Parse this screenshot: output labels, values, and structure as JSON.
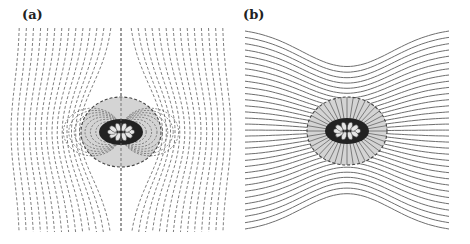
{
  "figure": {
    "panels": [
      {
        "id": "a",
        "label": "(a)",
        "line_style": "dashed",
        "line_orientation": "vertical",
        "region_shading": "#d4d4d4",
        "line_color": "#6e6e6e",
        "ellipse": {
          "cx": 121,
          "cy": 132,
          "rx": 40,
          "ry": 35
        },
        "field_extent": {
          "x0": 20,
          "x1": 222,
          "y0": 28,
          "y1": 232
        },
        "line_count": 29,
        "inner_core": {
          "petals": 10,
          "rx": 17,
          "ry": 9
        }
      },
      {
        "id": "b",
        "label": "(b)",
        "line_style": "solid",
        "line_orientation": "horizontal",
        "region_shading": "#d4d4d4",
        "line_color": "#6e6e6e",
        "ellipse": {
          "cx": 112,
          "cy": 131,
          "rx": 40,
          "ry": 34
        },
        "field_extent": {
          "x0": 10,
          "x1": 214,
          "y0": 28,
          "y1": 232
        },
        "line_count": 33,
        "inner_core": {
          "petals": 10,
          "rx": 17,
          "ry": 9
        }
      }
    ]
  }
}
